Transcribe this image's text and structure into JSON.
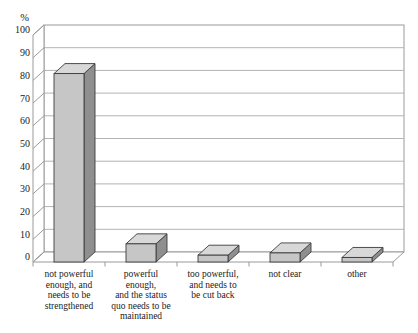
{
  "figure": {
    "kind": "3d-bar-chart",
    "unit_label": "%"
  },
  "chart_data": {
    "type": "bar",
    "style": "3d",
    "title": "",
    "xlabel": "",
    "ylabel": "%",
    "ylim": [
      0,
      100
    ],
    "yticks": [
      0,
      10,
      20,
      30,
      40,
      50,
      60,
      70,
      80,
      90,
      100
    ],
    "grid": true,
    "legend": false,
    "categories": [
      "not powerful\nenough, and\nneeds to be\nstrengthened",
      "powerful\nenough,\nand the status\nquo needs to be\nmaintained",
      "too powerful,\nand needs to\nbe cut back",
      "not clear",
      "other"
    ],
    "values": [
      83,
      8,
      3,
      4,
      2
    ],
    "colors": {
      "bar_front": "#c6c6c6",
      "bar_top": "#d8d8d8",
      "bar_side": "#8f8f8f",
      "bar_outline": "#3c3c3c",
      "gridline": "#b3b3b3",
      "frame": "#9a9a9a",
      "text": "#222222",
      "background": "#ffffff"
    }
  }
}
